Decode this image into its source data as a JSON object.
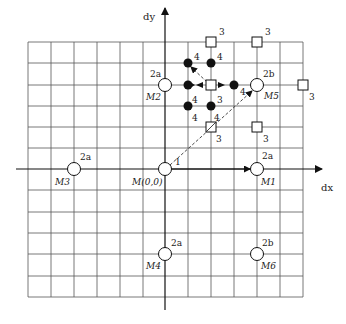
{
  "axes": {
    "x_label": "dx",
    "y_label": "dy"
  },
  "origin_label": "M(0,0)",
  "grid": {
    "cols": 12,
    "rows": 12,
    "x0": 28,
    "y0": 42,
    "x1": 303,
    "y1": 297
  },
  "macroblocks": [
    {
      "name": "M1",
      "cost": "2a"
    },
    {
      "name": "M2",
      "cost": "2a"
    },
    {
      "name": "M3",
      "cost": "2a"
    },
    {
      "name": "M4",
      "cost": "2a"
    },
    {
      "name": "M5",
      "cost": "2b"
    },
    {
      "name": "M6",
      "cost": "2b"
    }
  ],
  "step_labels": {
    "first_step": "1",
    "square_cost": "3",
    "dot_cost": "4"
  },
  "legend_markers": {
    "open_circle": "candidate predictor",
    "open_square": "step-3 search point",
    "filled_dot": "step-4 search point"
  }
}
